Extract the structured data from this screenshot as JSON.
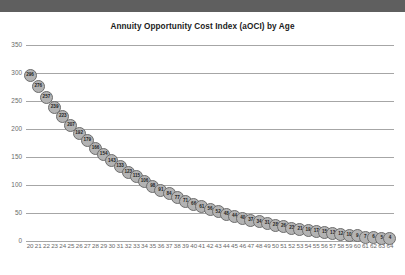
{
  "chart_data": {
    "type": "scatter",
    "title": "Annuity Opportunity Cost Index (aOCI) by Age",
    "xlabel": "",
    "ylabel": "",
    "xlim": [
      19.5,
      64.5
    ],
    "ylim": [
      0,
      350
    ],
    "grid": true,
    "legend": null,
    "y_ticks": [
      0,
      50,
      100,
      150,
      200,
      250,
      300,
      350
    ],
    "series_name": "aOCI",
    "marker_fill": "#b3b3b3",
    "marker_stroke": "#6d6d6d",
    "gridline_color": "#a6a6a6",
    "categories": [
      20,
      21,
      22,
      23,
      24,
      25,
      26,
      27,
      28,
      29,
      30,
      31,
      32,
      33,
      34,
      35,
      36,
      37,
      38,
      39,
      40,
      41,
      42,
      43,
      44,
      45,
      46,
      47,
      48,
      49,
      50,
      51,
      52,
      53,
      54,
      55,
      56,
      57,
      58,
      59,
      60,
      61,
      62,
      63,
      64
    ],
    "values": [
      296,
      276,
      257,
      239,
      223,
      207,
      192,
      179,
      166,
      154,
      143,
      133,
      123,
      115,
      106,
      98,
      91,
      84,
      77,
      71,
      66,
      61,
      56,
      52,
      48,
      44,
      40,
      37,
      34,
      31,
      28,
      26,
      23,
      21,
      19,
      17,
      15,
      13,
      12,
      10,
      9,
      7,
      6,
      5,
      4
    ],
    "point_labels": [
      "296",
      "276",
      "257",
      "239",
      "223",
      "207",
      "192",
      "179",
      "166",
      "154",
      "143",
      "133",
      "123",
      "115",
      "106",
      "98",
      "91",
      "84",
      "77",
      "71",
      "66",
      "61",
      "56",
      "52",
      "48",
      "44",
      "40",
      "37",
      "34",
      "31",
      "28",
      "26",
      "23",
      "21",
      "19",
      "17",
      "15",
      "13",
      "12",
      "10",
      "9",
      "7",
      "6",
      "5",
      "4"
    ]
  }
}
